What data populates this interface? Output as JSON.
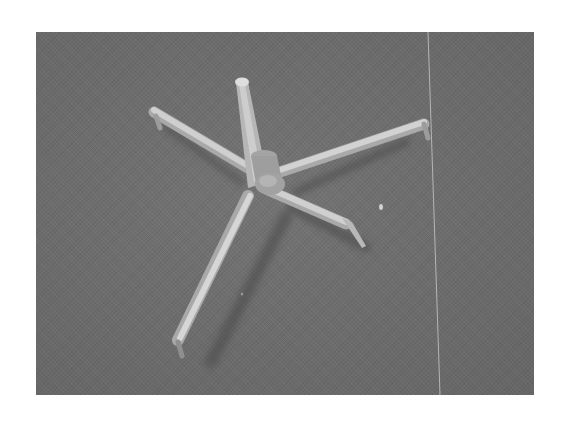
{
  "figure": {
    "alt": "Grayscale photograph of a 3D-printed five-strut star-shaped structure with a central vertical post on a textured gray surface",
    "colors": {
      "page_background": "#ffffff",
      "photo_background": "#6e6e6e",
      "strut_highlight": "#d8d8d8",
      "strut_body": "#b4b4b4",
      "shadow": "#555555",
      "divider_line": "#c8c8c8"
    }
  }
}
